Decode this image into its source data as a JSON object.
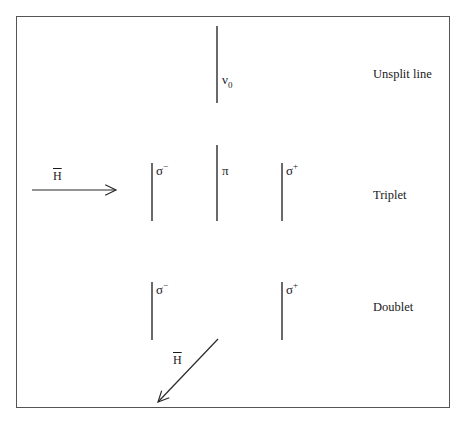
{
  "diagram": {
    "frame": {
      "x": 16,
      "y": 16,
      "width": 434,
      "height": 392,
      "stroke": "#555555"
    },
    "line_color": "#2a2a2a",
    "rows": [
      {
        "id": "unsplit",
        "label": "Unsplit line",
        "label_pos": {
          "x": 373,
          "y": 68
        },
        "lines": [
          {
            "name": "nu0",
            "x": 217,
            "y1": 26,
            "y2": 103,
            "symbol": "ν",
            "subscript": "0",
            "label_pos": {
              "x": 222,
              "y": 75
            }
          }
        ]
      },
      {
        "id": "triplet",
        "label": "Triplet",
        "label_pos": {
          "x": 373,
          "y": 189
        },
        "lines": [
          {
            "name": "sigma-minus",
            "x": 152,
            "y1": 163,
            "y2": 221,
            "symbol": "σ",
            "superscript": "−",
            "label_pos": {
              "x": 157,
              "y": 163
            }
          },
          {
            "name": "pi",
            "x": 217,
            "y1": 145,
            "y2": 221,
            "symbol": "π",
            "label_pos": {
              "x": 222,
              "y": 163
            }
          },
          {
            "name": "sigma-plus",
            "x": 282,
            "y1": 163,
            "y2": 221,
            "symbol": "σ",
            "superscript": "+",
            "label_pos": {
              "x": 287,
              "y": 163
            }
          }
        ]
      },
      {
        "id": "doublet",
        "label": "Doublet",
        "label_pos": {
          "x": 373,
          "y": 301
        },
        "lines": [
          {
            "name": "sigma-minus",
            "x": 152,
            "y1": 282,
            "y2": 340,
            "symbol": "σ",
            "superscript": "−",
            "label_pos": {
              "x": 157,
              "y": 283
            }
          },
          {
            "name": "sigma-plus",
            "x": 282,
            "y1": 282,
            "y2": 340,
            "symbol": "σ",
            "superscript": "+",
            "label_pos": {
              "x": 287,
              "y": 283
            }
          }
        ]
      }
    ],
    "field_arrows": [
      {
        "name": "h-transverse",
        "label": "H",
        "overbar": true,
        "x1": 32,
        "y1": 190,
        "x2": 116,
        "y2": 190,
        "label_pos": {
          "x": 52,
          "y": 168
        }
      },
      {
        "name": "h-longitudinal",
        "label": "H",
        "overbar": true,
        "x1": 218,
        "y1": 339,
        "x2": 158,
        "y2": 402,
        "label_pos": {
          "x": 172,
          "y": 352
        }
      }
    ]
  }
}
